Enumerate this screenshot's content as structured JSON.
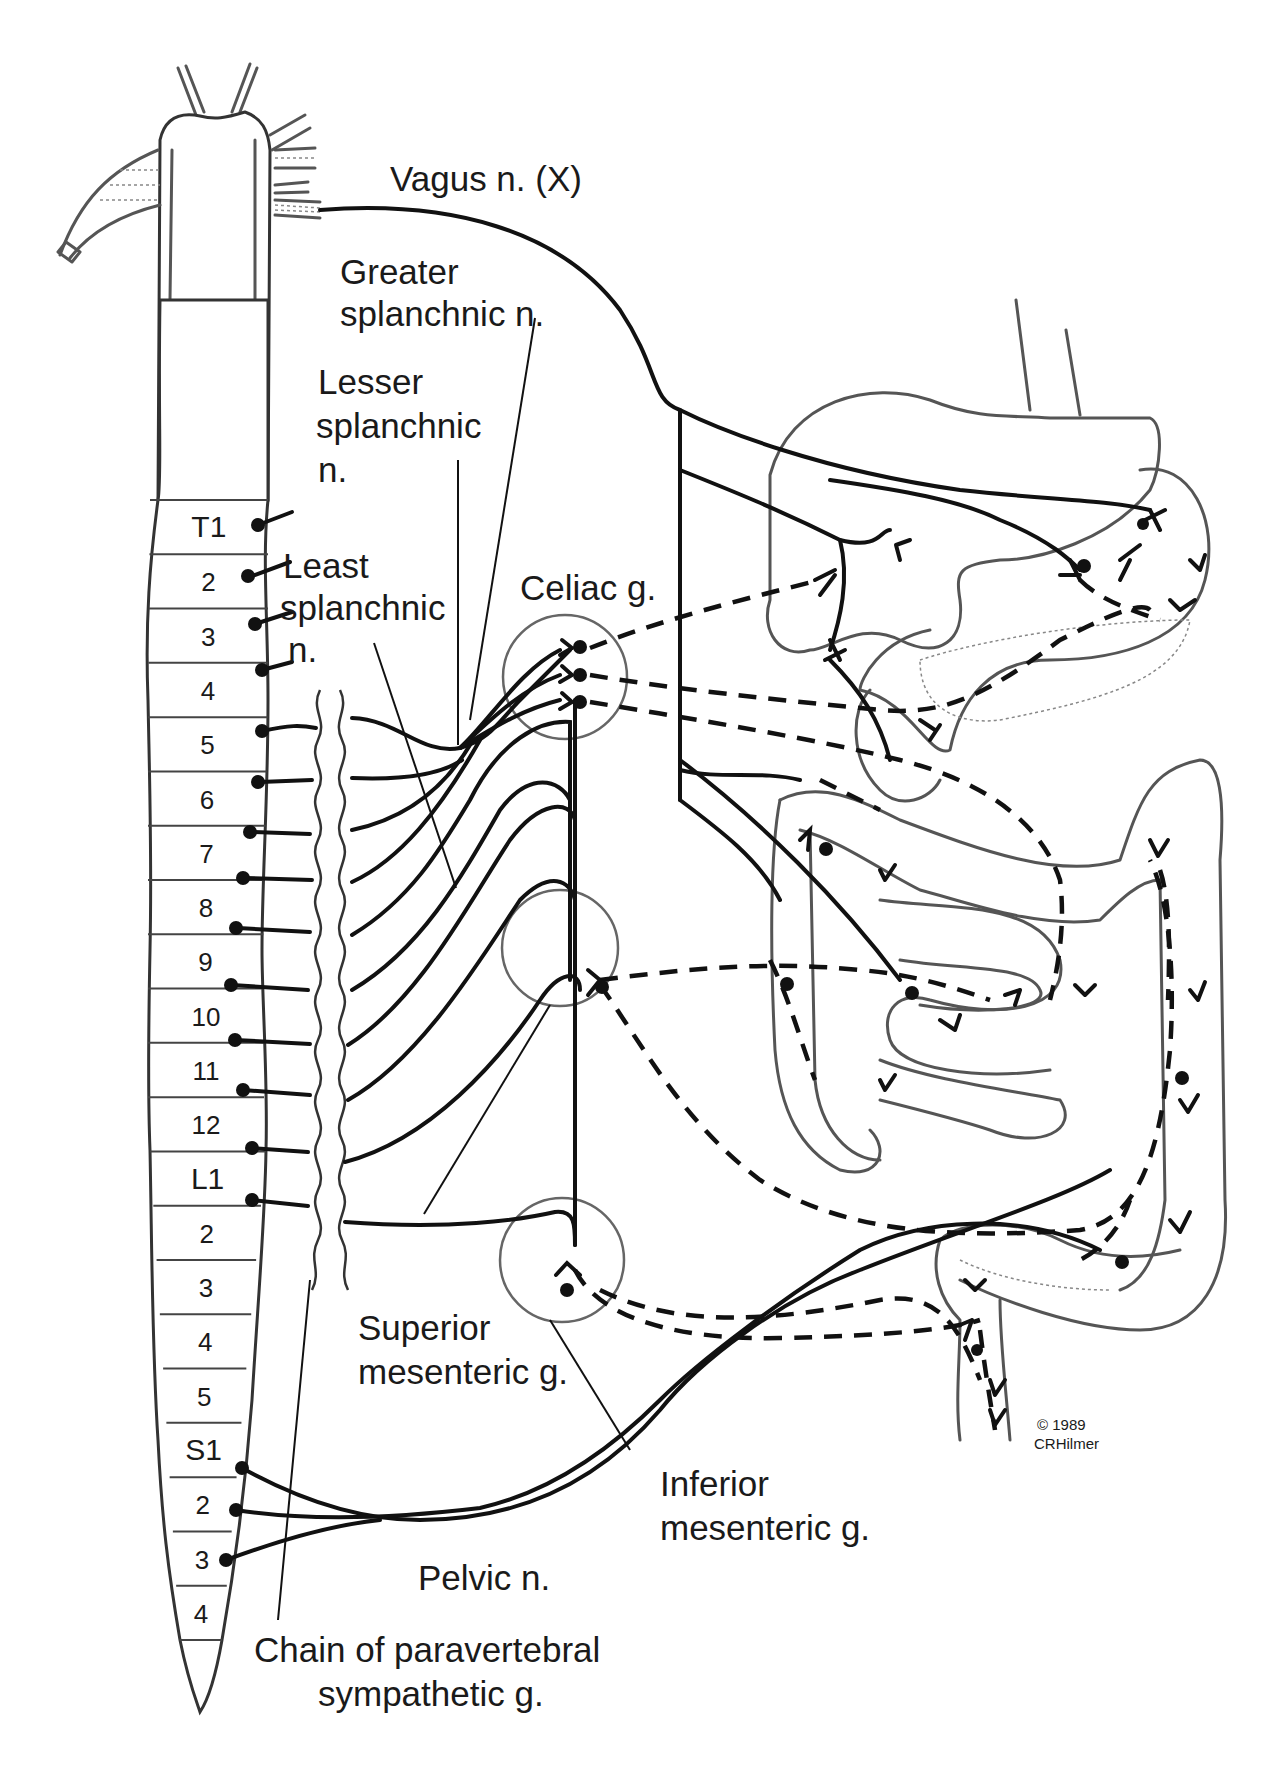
{
  "figure": {
    "copyright": "© 1989",
    "author": "CRHilmer"
  },
  "labels": {
    "vagus": "Vagus n. (X)",
    "greater_1": "Greater",
    "greater_2": "splanchnic n.",
    "lesser_1": "Lesser",
    "lesser_2": "splanchnic",
    "lesser_3": "n.",
    "least_1": "Least",
    "least_2": "splanchnic",
    "least_3": "n.",
    "celiac": "Celiac g.",
    "superior_1": "Superior",
    "superior_2": "mesenteric g.",
    "inferior_1": "Inferior",
    "inferior_2": "mesenteric g.",
    "pelvic": "Pelvic n.",
    "chain_1": "Chain of paravertebral",
    "chain_2": "sympathetic g."
  },
  "spinal_segments": [
    {
      "label": "T1",
      "region": "thoracic"
    },
    {
      "label": "2",
      "region": "thoracic"
    },
    {
      "label": "3",
      "region": "thoracic"
    },
    {
      "label": "4",
      "region": "thoracic"
    },
    {
      "label": "5",
      "region": "thoracic"
    },
    {
      "label": "6",
      "region": "thoracic"
    },
    {
      "label": "7",
      "region": "thoracic"
    },
    {
      "label": "8",
      "region": "thoracic"
    },
    {
      "label": "9",
      "region": "thoracic"
    },
    {
      "label": "10",
      "region": "thoracic"
    },
    {
      "label": "11",
      "region": "thoracic"
    },
    {
      "label": "12",
      "region": "thoracic"
    },
    {
      "label": "L1",
      "region": "lumbar"
    },
    {
      "label": "2",
      "region": "lumbar"
    },
    {
      "label": "3",
      "region": "lumbar"
    },
    {
      "label": "4",
      "region": "lumbar"
    },
    {
      "label": "5",
      "region": "lumbar"
    },
    {
      "label": "S1",
      "region": "sacral"
    },
    {
      "label": "2",
      "region": "sacral"
    },
    {
      "label": "3",
      "region": "sacral"
    },
    {
      "label": "4",
      "region": "sacral"
    }
  ],
  "legend_styles": {
    "preganglionic": "solid line",
    "postganglionic": "dashed line",
    "ganglion": "circle outline"
  }
}
